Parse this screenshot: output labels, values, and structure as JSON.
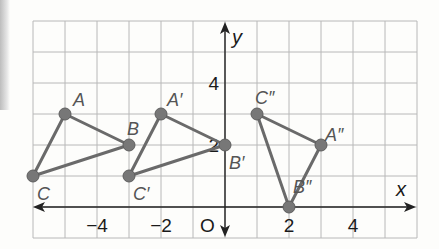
{
  "diagram": {
    "type": "coordinate-plane-transformations",
    "axes": {
      "x_label": "x",
      "y_label": "y",
      "origin_label": "O",
      "x_range": [
        -6,
        6
      ],
      "y_range": [
        -1,
        6
      ],
      "x_ticks": [
        {
          "value": -4,
          "label": "−4"
        },
        {
          "value": -2,
          "label": "−2"
        },
        {
          "value": 2,
          "label": "2"
        },
        {
          "value": 4,
          "label": "4"
        }
      ],
      "y_ticks": [
        {
          "value": 4,
          "label": "4"
        },
        {
          "value": 2,
          "label": "2"
        }
      ]
    },
    "triangles": [
      {
        "name": "ABC",
        "points": [
          {
            "label": "A",
            "x": -5,
            "y": 3
          },
          {
            "label": "B",
            "x": -3,
            "y": 2
          },
          {
            "label": "C",
            "x": -6,
            "y": 1
          }
        ]
      },
      {
        "name": "A'B'C'",
        "points": [
          {
            "label": "A′",
            "x": -2,
            "y": 3
          },
          {
            "label": "B′",
            "x": 0,
            "y": 2
          },
          {
            "label": "C′",
            "x": -3,
            "y": 1
          }
        ]
      },
      {
        "name": "A''B''C''",
        "points": [
          {
            "label": "A″",
            "x": 3,
            "y": 2
          },
          {
            "label": "B″",
            "x": 2,
            "y": 0
          },
          {
            "label": "C″",
            "x": 1,
            "y": 3
          }
        ]
      }
    ],
    "colors": {
      "grid": "#b8b8b8",
      "axes": "#222222",
      "triangle": "#6a6a6a",
      "point": "#777777",
      "point_label": "#555555"
    }
  }
}
